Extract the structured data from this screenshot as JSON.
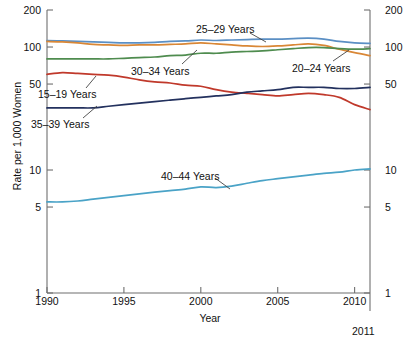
{
  "figure": {
    "xlabel": "Year",
    "ylabel": "Rate per 1,000 Women",
    "end_year_label": "2011",
    "caption": ""
  },
  "chart_data": {
    "type": "line",
    "title": "",
    "xlabel": "Year",
    "ylabel": "Rate per 1,000 Women",
    "yscale": "log",
    "ylim": [
      1,
      200
    ],
    "xlim": [
      1990,
      2011
    ],
    "yticks": [
      1,
      5,
      10,
      50,
      100,
      200
    ],
    "ytick_labels": [
      "1",
      "5",
      "10",
      "50",
      "100",
      "200"
    ],
    "xticks": [
      1990,
      1995,
      2000,
      2005,
      2010
    ],
    "xtick_labels": [
      "1990",
      "1995",
      "2000",
      "2005",
      "2010"
    ],
    "grid": false,
    "legend_position": "inline-annotations",
    "x": [
      1990,
      1991,
      1992,
      1993,
      1994,
      1995,
      1996,
      1997,
      1998,
      1999,
      2000,
      2001,
      2002,
      2003,
      2004,
      2005,
      2006,
      2007,
      2008,
      2009,
      2010,
      2011
    ],
    "series": [
      {
        "name": "25-29 Years",
        "label": "25–29 Years",
        "color": "#5b8fc4",
        "values": [
          113,
          112,
          111,
          110,
          109,
          108,
          108,
          109,
          111,
          112,
          114,
          113,
          114,
          115,
          116,
          116,
          117,
          118,
          116,
          111,
          108,
          107
        ]
      },
      {
        "name": "20-24 Years",
        "label": "20–24 Years",
        "color": "#d98736",
        "values": [
          111,
          110,
          108,
          105,
          104,
          103,
          104,
          104,
          105,
          106,
          108,
          106,
          104,
          102,
          101,
          102,
          104,
          106,
          103,
          96,
          90,
          85
        ]
      },
      {
        "name": "30-34 Years",
        "label": "30–34 Years",
        "color": "#4f8c4f",
        "values": [
          80,
          80,
          80,
          80,
          80,
          81,
          82,
          83,
          85,
          86,
          89,
          89,
          91,
          92,
          93,
          95,
          97,
          99,
          99,
          97,
          96,
          97
        ]
      },
      {
        "name": "15-19 Years",
        "label": "15–19 Years",
        "color": "#c0392b",
        "values": [
          60,
          62,
          61,
          60,
          59,
          57,
          54,
          52,
          51,
          49,
          48,
          45,
          43,
          42,
          41,
          40,
          41,
          42,
          41,
          39,
          34,
          31
        ]
      },
      {
        "name": "35-39 Years",
        "label": "35–39 Years",
        "color": "#23315e",
        "values": [
          32,
          32,
          32,
          32,
          33,
          34,
          35,
          36,
          37,
          38,
          39,
          40,
          41,
          43,
          44,
          45,
          47,
          47,
          47,
          46,
          46,
          47
        ]
      },
      {
        "name": "40-44 Years",
        "label": "40–44 Years",
        "color": "#4aa3c7",
        "values": [
          5.5,
          5.5,
          5.6,
          5.8,
          6.0,
          6.2,
          6.4,
          6.6,
          6.8,
          7.0,
          7.3,
          7.2,
          7.4,
          7.8,
          8.2,
          8.5,
          8.8,
          9.1,
          9.4,
          9.6,
          10.0,
          10.2
        ]
      }
    ],
    "annotations": [
      {
        "text": "25–29 Years",
        "x_px": 196,
        "y_px": 24,
        "leader": {
          "x1": 250,
          "y1": 33,
          "x2": 266,
          "y2": 42
        }
      },
      {
        "text": "20–24 Years",
        "x_px": 292,
        "y_px": 63,
        "leader": {
          "x1": 333,
          "y1": 61,
          "x2": 349,
          "y2": 50
        }
      },
      {
        "text": "30–34 Years",
        "x_px": 131,
        "y_px": 66,
        "leader": {
          "x1": 182,
          "y1": 64,
          "x2": 197,
          "y2": 50
        }
      },
      {
        "text": "15–19 Years",
        "x_px": 38,
        "y_px": 89,
        "leader": {
          "x1": 86,
          "y1": 88,
          "x2": 96,
          "y2": 76
        }
      },
      {
        "text": "35–39 Years",
        "x_px": 31,
        "y_px": 119,
        "leader": {
          "x1": 83,
          "y1": 118,
          "x2": 97,
          "y2": 106
        }
      },
      {
        "text": "40–44 Years",
        "x_px": 161,
        "y_px": 171,
        "leader": {
          "x1": 215,
          "y1": 178,
          "x2": 230,
          "y2": 189
        }
      }
    ]
  }
}
